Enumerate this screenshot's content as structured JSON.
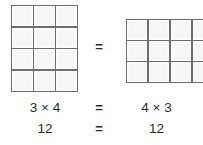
{
  "figure": {
    "line_color": "#6e6e6e",
    "cell_color": "#f6f6f6",
    "text_color": "#2b2b2b"
  },
  "arrays": {
    "left": {
      "name": "3 by 4 array",
      "columns": 3,
      "rows": 4,
      "total": 12
    },
    "right": {
      "name": "4 by 3 array",
      "columns": 4,
      "rows": 3,
      "total": 12
    }
  },
  "middle_operator": "=",
  "equations": [
    {
      "left": "3 × 4",
      "operator": "=",
      "right": "4 × 3"
    },
    {
      "left": "12",
      "operator": "=",
      "right": "12"
    }
  ]
}
